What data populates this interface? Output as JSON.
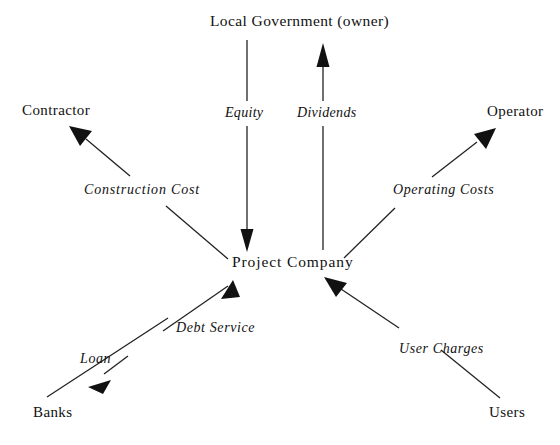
{
  "diagram": {
    "background_color": "#ffffff",
    "stroke_color": "#222222",
    "text_color": "#111111",
    "nodes": [
      {
        "id": "local-government",
        "label": "Local Government (owner)"
      },
      {
        "id": "contractor",
        "label": "Contractor"
      },
      {
        "id": "operator",
        "label": "Operator"
      },
      {
        "id": "project-company",
        "label": "Project  Company"
      },
      {
        "id": "banks",
        "label": "Banks"
      },
      {
        "id": "users",
        "label": "Users"
      }
    ],
    "edges": [
      {
        "id": "equity",
        "label": "Equity",
        "from": "local-government",
        "to": "project-company"
      },
      {
        "id": "dividends",
        "label": "Dividends",
        "from": "project-company",
        "to": "local-government"
      },
      {
        "id": "construction-cost",
        "label": "Construction Cost",
        "from": "project-company",
        "to": "contractor"
      },
      {
        "id": "operating-costs",
        "label": "Operating Costs",
        "from": "project-company",
        "to": "operator"
      },
      {
        "id": "loan",
        "label": "Loan",
        "from": "project-company",
        "to": "banks"
      },
      {
        "id": "debt-service",
        "label": "Debt Service",
        "from": "banks",
        "to": "project-company"
      },
      {
        "id": "user-charges",
        "label": "User Charges",
        "from": "users",
        "to": "project-company"
      }
    ]
  }
}
